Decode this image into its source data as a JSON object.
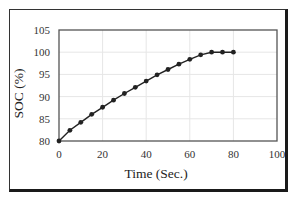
{
  "chart_data": {
    "type": "line",
    "title": "",
    "xlabel": "Time (Sec.)",
    "ylabel": "SOC (%)",
    "xlim": [
      0,
      100
    ],
    "ylim": [
      80,
      105
    ],
    "x_ticks": [
      0,
      20,
      40,
      60,
      80,
      100
    ],
    "y_ticks": [
      80,
      85,
      90,
      95,
      100,
      105
    ],
    "x_tick_labels": [
      "0",
      "20",
      "40",
      "60",
      "80",
      "100"
    ],
    "y_tick_labels": [
      "80",
      "85",
      "90",
      "95",
      "100",
      "105"
    ],
    "grid": true,
    "legend": null,
    "series": [
      {
        "name": "SOC",
        "marker": "circle",
        "color": "#222222",
        "x": [
          0,
          5,
          10,
          15,
          20,
          25,
          30,
          35,
          40,
          45,
          50,
          55,
          60,
          65,
          70,
          75,
          80
        ],
        "values": [
          80,
          82.4,
          84.2,
          86.0,
          87.6,
          89.2,
          90.7,
          92.1,
          93.5,
          94.9,
          96.1,
          97.3,
          98.4,
          99.4,
          100,
          100,
          100
        ]
      }
    ]
  },
  "colors": {
    "line": "#222222",
    "grid": "#e6e6e6",
    "axis": "#555555",
    "frame": "#1a1a1a"
  }
}
